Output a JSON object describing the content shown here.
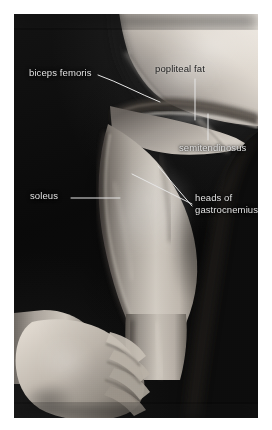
{
  "figure": {
    "kind": "anatomical-surface-photograph",
    "background_color": "#0a0a0a",
    "plate_margin_color": "#ffffff",
    "label_color_on_dark": "#e2e2e2",
    "label_color_on_light": "#1b1b1b",
    "leader_line_color": "#e6e6e6"
  },
  "labels": {
    "biceps_femoris": "biceps femoris",
    "popliteal_fat": "popliteal fat",
    "semitendinosus": "semitendinosus",
    "soleus": "soleus",
    "heads_of_gastrocnemius_line1": "heads of",
    "heads_of_gastrocnemius_line2": "gastrocnemius"
  }
}
